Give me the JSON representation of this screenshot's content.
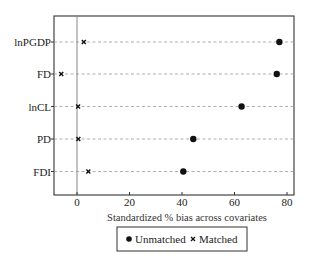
{
  "chart_data": {
    "type": "scatter",
    "title": "",
    "xlabel": "Standardized % bias across covariates",
    "ylabel": "",
    "xlim": [
      -9,
      82
    ],
    "xticks": [
      0,
      20,
      40,
      60,
      80
    ],
    "grid": "dashed horizontal lines per category",
    "legend_position": "bottom",
    "categories": [
      "lnPGDP",
      "FD",
      "lnCL",
      "PD",
      "FDI"
    ],
    "series": [
      {
        "name": "Unmatched",
        "marker": "filled-circle",
        "values": [
          77.1,
          76.1,
          62.7,
          44.3,
          40.5
        ]
      },
      {
        "name": "Matched",
        "marker": "x",
        "values": [
          2.6,
          -6.0,
          0.4,
          0.5,
          4.3
        ]
      }
    ],
    "reference_line": {
      "axis": "x",
      "value": 0
    }
  },
  "legend": {
    "items": [
      {
        "label": "Unmatched",
        "icon": "filled-circle-marker"
      },
      {
        "label": "Matched",
        "icon": "x-marker"
      }
    ]
  },
  "colors": {
    "marker": "#111111",
    "axis": "#333333",
    "gridline": "#999999",
    "reference_line": "#888888"
  }
}
